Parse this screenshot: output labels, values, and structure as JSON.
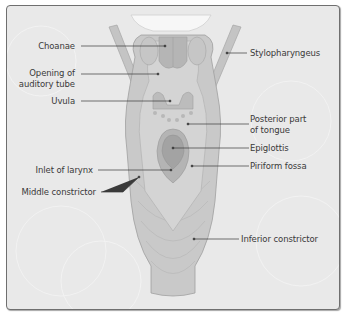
{
  "diagram": {
    "colors": {
      "background": "#e9e9e9",
      "frame_border": "#6f6f6f",
      "tissue_light": "#d6d6d6",
      "tissue_mid": "#bdbdbd",
      "tissue_dark": "#a9a9a9",
      "epiglottis": "#9f9f9f",
      "leader_line": "#3a3a3a",
      "label_text": "#3a3a3a"
    },
    "labels_left": [
      {
        "id": "choanae",
        "text": "Choanae"
      },
      {
        "id": "auditory-tube-1",
        "text": "Opening of"
      },
      {
        "id": "auditory-tube-2",
        "text": "auditory tube"
      },
      {
        "id": "uvula",
        "text": "Uvula"
      },
      {
        "id": "inlet-larynx",
        "text": "Inlet of larynx"
      },
      {
        "id": "middle-constrictor",
        "text": "Middle constrictor"
      }
    ],
    "labels_right": [
      {
        "id": "stylopharyngeus",
        "text": "Stylopharyngeus"
      },
      {
        "id": "posterior-tongue-1",
        "text": "Posterior part"
      },
      {
        "id": "posterior-tongue-2",
        "text": "of tongue"
      },
      {
        "id": "epiglottis",
        "text": "Epiglottis"
      },
      {
        "id": "piriform-fossa",
        "text": "Piriform fossa"
      },
      {
        "id": "inferior-constrictor",
        "text": "Inferior constrictor"
      }
    ]
  }
}
